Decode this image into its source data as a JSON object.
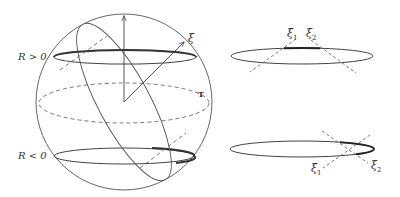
{
  "figure": {
    "type": "sphere-diagram",
    "left_panel": {
      "labels": {
        "r_positive": "R > 0",
        "r_negative": "R < 0",
        "xi": "ξ",
        "t": "T"
      }
    },
    "right_top_panel": {
      "labels": {
        "xi1": "ξ",
        "xi1_sub": "1",
        "xi2": "ξ",
        "xi2_sub": "2"
      }
    },
    "right_bottom_panel": {
      "labels": {
        "xi1": "ξ",
        "xi1_sub": "1",
        "xi2": "ξ",
        "xi2_sub": "2"
      }
    },
    "colors": {
      "stroke": "#444444",
      "background": "#ffffff"
    }
  }
}
